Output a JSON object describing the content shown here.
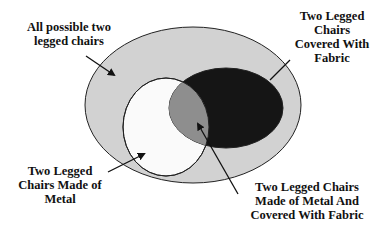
{
  "diagram": {
    "type": "venn",
    "colors": {
      "universe": "#d2d2d2",
      "metal": "#fafafa",
      "fabric": "#151515",
      "intersection": "#8e8e8e",
      "stroke": "#222222"
    },
    "labels": {
      "universe": "All possible two\nlegged chairs",
      "fabric": "Two Legged\nChairs\nCovered With\nFabric",
      "metal": "Two Legged\nChairs Made of\nMetal",
      "intersection": "Two Legged Chairs\nMade of Metal And\nCovered With Fabric"
    }
  }
}
